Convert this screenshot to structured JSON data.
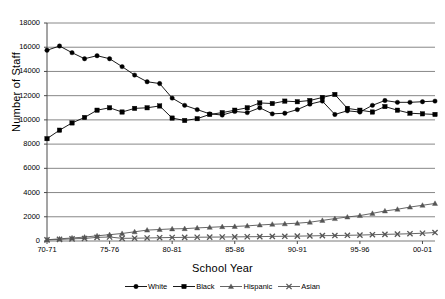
{
  "chart_data": {
    "type": "line",
    "title": "",
    "xlabel": "School Year",
    "ylabel": "Number of Staff",
    "ylim": [
      0,
      18000
    ],
    "ytick_values": [
      0,
      2000,
      4000,
      6000,
      8000,
      10000,
      12000,
      14000,
      16000,
      18000
    ],
    "ytick_labels": [
      "0",
      "2000",
      "4000",
      "6000",
      "8000",
      "10000",
      "12000",
      "14000",
      "16000",
      "18000"
    ],
    "grid": "horizontal",
    "legend_position": "bottom",
    "x": [
      "70-71",
      "71-72",
      "72-73",
      "73-74",
      "74-75",
      "75-76",
      "76-77",
      "77-78",
      "78-79",
      "79-80",
      "80-81",
      "81-82",
      "82-83",
      "83-84",
      "84-85",
      "85-86",
      "86-87",
      "87-88",
      "88-89",
      "89-90",
      "90-91",
      "91-92",
      "92-93",
      "93-94",
      "94-95",
      "95-96",
      "96-97",
      "97-98",
      "98-99",
      "99-00",
      "00-01",
      "01-02"
    ],
    "xtick_labels": [
      "70-71",
      "75-76",
      "80-81",
      "85-86",
      "90-91",
      "95-96",
      "00-01"
    ],
    "xtick_indices": [
      0,
      5,
      10,
      15,
      20,
      25,
      30
    ],
    "series": [
      {
        "name": "White",
        "marker": "circle",
        "color": "#000000",
        "values": [
          15750,
          16100,
          15550,
          15050,
          15300,
          15050,
          14400,
          13700,
          13150,
          13000,
          11800,
          11200,
          10850,
          10500,
          10400,
          10700,
          10600,
          11000,
          10500,
          10550,
          10850,
          11300,
          11550,
          10450,
          10750,
          10650,
          11200,
          11600,
          11450,
          11450,
          11500,
          11550
        ]
      },
      {
        "name": "Black",
        "marker": "square",
        "color": "#000000",
        "values": [
          8450,
          9150,
          9750,
          10200,
          10800,
          11000,
          10650,
          10950,
          11000,
          11150,
          10150,
          9950,
          10100,
          10450,
          10600,
          10800,
          11000,
          11400,
          11350,
          11550,
          11500,
          11600,
          11850,
          12100,
          10950,
          10800,
          10650,
          11100,
          10800,
          10550,
          10500,
          10450
        ]
      },
      {
        "name": "Hispanic",
        "marker": "triangle",
        "color": "#555555",
        "values": [
          100,
          180,
          250,
          320,
          430,
          520,
          620,
          760,
          900,
          950,
          1000,
          1020,
          1080,
          1130,
          1180,
          1200,
          1250,
          1320,
          1380,
          1420,
          1470,
          1550,
          1700,
          1850,
          1980,
          2100,
          2280,
          2480,
          2620,
          2800,
          2950,
          3100
        ]
      },
      {
        "name": "Asian",
        "marker": "cross",
        "color": "#555555",
        "values": [
          90,
          130,
          180,
          210,
          300,
          330,
          220,
          230,
          250,
          270,
          290,
          300,
          310,
          320,
          330,
          340,
          350,
          360,
          380,
          390,
          400,
          420,
          440,
          450,
          470,
          490,
          520,
          550,
          570,
          600,
          640,
          700
        ]
      }
    ]
  },
  "legend": {
    "items": [
      {
        "label": "White"
      },
      {
        "label": "Black"
      },
      {
        "label": "Hispanic"
      },
      {
        "label": "Asian"
      }
    ]
  }
}
